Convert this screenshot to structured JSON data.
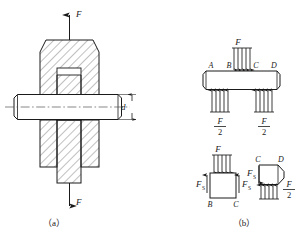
{
  "figure": {
    "caption_a": "（a）",
    "caption_b": "（b）",
    "colors": {
      "line": "#1a1a1a",
      "hatch": "#4a4a4a",
      "background": "#ffffff",
      "centerline": "#555555"
    }
  },
  "panel_a": {
    "name": "clevis-pin-assembly-section-view",
    "load_top_label": "F",
    "load_bottom_label": "F",
    "diameter_label": "d",
    "caption": "（a）"
  },
  "panel_b": {
    "name": "free-body-diagrams",
    "caption": "（b）",
    "pin_loading": {
      "point_labels": [
        "A",
        "B",
        "C",
        "D"
      ],
      "top_load_label": "F",
      "left_reaction_num": "F",
      "left_reaction_den": "2",
      "right_reaction_num": "F",
      "right_reaction_den": "2"
    },
    "fbd_middle": {
      "segment_labels": [
        "B",
        "C"
      ],
      "applied_load_label": "F",
      "shear_left_label": "F",
      "shear_left_sub": "S",
      "shear_right_label": "F",
      "shear_right_sub": "S"
    },
    "fbd_right": {
      "segment_labels": [
        "C",
        "D"
      ],
      "shear_label": "F",
      "shear_sub": "S",
      "reaction_num": "F",
      "reaction_den": "2"
    }
  }
}
